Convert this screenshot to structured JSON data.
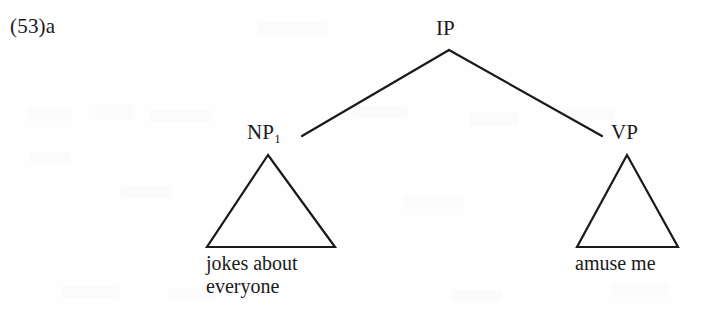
{
  "figure": {
    "example_number": "(53)a",
    "type": "syntax-tree",
    "notation": "phrase-structure tree with triangle abbreviations"
  },
  "tree": {
    "root": {
      "label": "IP",
      "subscript": "",
      "x": 449,
      "y": 38
    },
    "children": [
      {
        "label": "NP",
        "subscript": "1",
        "x": 268,
        "y": 142,
        "triangle": {
          "apex_x": 268,
          "apex_y": 155,
          "left_x": 207,
          "right_x": 335,
          "base_y": 247
        },
        "terminal_lines": [
          "jokes about",
          "everyone"
        ]
      },
      {
        "label": "VP",
        "subscript": "",
        "x": 627,
        "y": 142,
        "triangle": {
          "apex_x": 627,
          "apex_y": 155,
          "left_x": 577,
          "right_x": 678,
          "base_y": 247
        },
        "terminal_lines": [
          "amuse me"
        ]
      }
    ]
  },
  "style": {
    "ink_color": "#1a1a1a",
    "background_color": "#fefefe",
    "artifact_color": "#fbfbfb",
    "stroke_width": 2.2
  }
}
